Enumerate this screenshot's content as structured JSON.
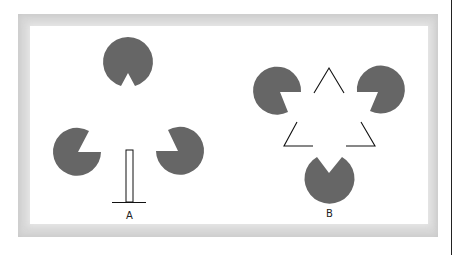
{
  "figure": {
    "type": "illusory-contour-diagram",
    "colors": {
      "inducer_fill": "#666666",
      "line": "#111111",
      "frame": "#d6d6d6",
      "background": "#ffffff"
    },
    "panels": [
      {
        "id": "A",
        "label": "A",
        "description": "Three notched discs arranged in a triangle with a vertical bar standing on a horizontal base line"
      },
      {
        "id": "B",
        "label": "B",
        "description": "Three notched discs with three open line angles forming an illusory (Kanizsa) triangle"
      }
    ]
  }
}
